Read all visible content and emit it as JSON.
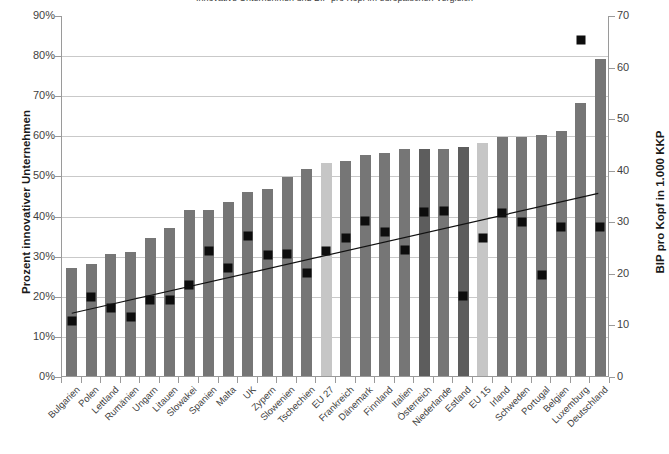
{
  "chart_data": {
    "type": "bar",
    "title": "Innovative Unternehmen und BIP pro Kopf im europäischen Vergleich",
    "xlabel": "",
    "ylabel": "Prozent innovativer Unternehmen",
    "y2label": "BIP pro Kopf in 1.000 KKP",
    "ylim": [
      0,
      0.9
    ],
    "y2lim": [
      0,
      70
    ],
    "grid": true,
    "legend": "none",
    "ytick_labels": [
      "90%",
      "80%",
      "70%",
      "60%",
      "50%",
      "40%",
      "30%",
      "20%",
      "10%",
      "0%"
    ],
    "ytick_values": [
      0.9,
      0.8,
      0.7,
      0.6,
      0.5,
      0.4,
      0.3,
      0.2,
      0.1,
      0
    ],
    "y2tick_labels": [
      "70",
      "60",
      "50",
      "40",
      "30",
      "20",
      "10",
      "0"
    ],
    "y2tick_values": [
      70,
      60,
      50,
      40,
      30,
      20,
      10,
      0
    ],
    "categories": [
      "Bulgarien",
      "Polen",
      "Lettland",
      "Rumänien",
      "Ungarn",
      "Litauen",
      "Slowakei",
      "Spanien",
      "Malta",
      "UK",
      "Zypern",
      "Slowenien",
      "Tschechien",
      "EU 27",
      "Frankreich",
      "Dänemark",
      "Finnland",
      "Italien",
      "Österreich",
      "Niederlande",
      "Estland",
      "EU 15",
      "Irland",
      "Schweden",
      "Portugal",
      "Belgien",
      "Luxemburg",
      "Deutschland"
    ],
    "series": [
      {
        "name": "Prozent innovativer Unternehmen",
        "axis": "left",
        "type": "bar",
        "color": "#767676",
        "highlight_color": "#c6c6c6",
        "highlight_categories": [
          "EU 27",
          "EU 15"
        ],
        "dark_categories": [
          "Österreich",
          "Estland"
        ],
        "values": [
          0.27,
          0.28,
          0.305,
          0.31,
          0.345,
          0.37,
          0.415,
          0.415,
          0.435,
          0.46,
          0.465,
          0.495,
          0.515,
          0.53,
          0.535,
          0.55,
          0.555,
          0.565,
          0.565,
          0.565,
          0.57,
          0.58,
          0.595,
          0.595,
          0.6,
          0.61,
          0.68,
          0.79
        ]
      },
      {
        "name": "BIP pro Kopf in 1.000 KKP",
        "axis": "right",
        "type": "scatter",
        "color": "#0d0d0d",
        "marker": "square",
        "values": [
          10.9,
          15.5,
          13.3,
          11.7,
          14.9,
          15.0,
          17.8,
          24.4,
          21.2,
          27.4,
          23.6,
          23.8,
          20.2,
          24.5,
          26.9,
          30.3,
          28.1,
          24.7,
          31.9,
          32.1,
          15.7,
          27.0,
          31.8,
          30.0,
          19.7,
          29.1,
          65.3,
          29.0
        ]
      },
      {
        "name": "Trendlinie",
        "type": "line",
        "color": "#111111",
        "x_from": "Bulgarien",
        "x_to": "Deutschland",
        "y_from_right_axis": 12.2,
        "y_to_right_axis": 35.5
      }
    ]
  }
}
